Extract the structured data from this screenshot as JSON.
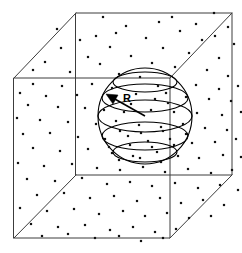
{
  "figure": {
    "labels": {
      "radius": "R"
    },
    "colors": {
      "background": "#ffffff",
      "cube_edge": "#3c3c3c",
      "sphere_line": "#000000",
      "particle": "#111111",
      "arrow": "#000000"
    },
    "label_positions": {
      "radius_x": 123,
      "radius_y": 93
    }
  },
  "chart_data": {
    "type": "scatter",
    "xlabel": "",
    "ylabel": "",
    "annotations": [
      "R"
    ],
    "geometry": {
      "cube": {
        "front_face": {
          "top_left": [
            14,
            78
          ],
          "top_right": [
            170,
            78
          ],
          "bottom_right": [
            170,
            238
          ],
          "bottom_left": [
            14,
            238
          ]
        },
        "back_face": {
          "top_left": [
            76,
            13
          ],
          "top_right": [
            232,
            13
          ],
          "bottom_right": [
            232,
            175
          ],
          "bottom_left": [
            76,
            175
          ]
        },
        "visible_connectors": [
          [
            [
              14,
              78
            ],
            [
              76,
              13
            ]
          ],
          [
            [
              170,
              78
            ],
            [
              232,
              13
            ]
          ],
          [
            [
              170,
              238
            ],
            [
              232,
              175
            ]
          ],
          [
            [
              14,
              238
            ],
            [
              76,
              175
            ]
          ]
        ]
      },
      "sphere": {
        "center": [
          145,
          116
        ],
        "radius_x": 47,
        "radius_y": 48,
        "latitude_rings_ry": [
          10,
          14,
          16,
          14,
          10
        ],
        "latitude_rings_cy": [
          82,
          98,
          116,
          136,
          152
        ]
      },
      "radius_arrow": {
        "from": [
          145,
          116
        ],
        "to": [
          110,
          96
        ]
      }
    },
    "particles": [
      [
        103,
        17
      ],
      [
        172,
        17
      ],
      [
        214,
        13
      ],
      [
        126,
        26
      ],
      [
        180,
        31
      ],
      [
        228,
        27
      ],
      [
        96,
        36
      ],
      [
        146,
        38
      ],
      [
        202,
        40
      ],
      [
        234,
        44
      ],
      [
        110,
        47
      ],
      [
        163,
        48
      ],
      [
        189,
        53
      ],
      [
        88,
        57
      ],
      [
        131,
        56
      ],
      [
        219,
        58
      ],
      [
        244,
        60
      ],
      [
        100,
        64
      ],
      [
        152,
        63
      ],
      [
        175,
        67
      ],
      [
        207,
        70
      ],
      [
        70,
        72
      ],
      [
        119,
        74
      ],
      [
        140,
        77
      ],
      [
        228,
        76
      ],
      [
        33,
        84
      ],
      [
        62,
        86
      ],
      [
        92,
        84
      ],
      [
        112,
        88
      ],
      [
        158,
        86
      ],
      [
        196,
        85
      ],
      [
        219,
        89
      ],
      [
        238,
        86
      ],
      [
        20,
        93
      ],
      [
        46,
        96
      ],
      [
        77,
        95
      ],
      [
        136,
        94
      ],
      [
        166,
        93
      ],
      [
        186,
        97
      ],
      [
        209,
        99
      ],
      [
        231,
        101
      ],
      [
        28,
        105
      ],
      [
        58,
        107
      ],
      [
        85,
        108
      ],
      [
        104,
        110
      ],
      [
        124,
        112
      ],
      [
        151,
        110
      ],
      [
        174,
        112
      ],
      [
        197,
        113
      ],
      [
        222,
        115
      ],
      [
        241,
        112
      ],
      [
        17,
        118
      ],
      [
        40,
        120
      ],
      [
        68,
        122
      ],
      [
        96,
        124
      ],
      [
        116,
        121
      ],
      [
        139,
        125
      ],
      [
        161,
        127
      ],
      [
        183,
        124
      ],
      [
        205,
        128
      ],
      [
        227,
        130
      ],
      [
        23,
        134
      ],
      [
        50,
        133
      ],
      [
        78,
        137
      ],
      [
        105,
        139
      ],
      [
        128,
        136
      ],
      [
        148,
        141
      ],
      [
        170,
        139
      ],
      [
        192,
        143
      ],
      [
        215,
        142
      ],
      [
        236,
        139
      ],
      [
        33,
        148
      ],
      [
        60,
        151
      ],
      [
        88,
        149
      ],
      [
        112,
        153
      ],
      [
        133,
        156
      ],
      [
        157,
        152
      ],
      [
        178,
        156
      ],
      [
        199,
        158
      ],
      [
        223,
        155
      ],
      [
        241,
        157
      ],
      [
        18,
        163
      ],
      [
        44,
        166
      ],
      [
        72,
        164
      ],
      [
        97,
        168
      ],
      [
        120,
        170
      ],
      [
        143,
        167
      ],
      [
        165,
        172
      ],
      [
        188,
        169
      ],
      [
        211,
        173
      ],
      [
        232,
        170
      ],
      [
        27,
        179
      ],
      [
        55,
        181
      ],
      [
        82,
        178
      ],
      [
        107,
        184
      ],
      [
        130,
        182
      ],
      [
        152,
        186
      ],
      [
        175,
        183
      ],
      [
        198,
        188
      ],
      [
        220,
        185
      ],
      [
        238,
        190
      ],
      [
        37,
        195
      ],
      [
        64,
        193
      ],
      [
        90,
        198
      ],
      [
        114,
        196
      ],
      [
        137,
        201
      ],
      [
        160,
        198
      ],
      [
        181,
        203
      ],
      [
        203,
        200
      ],
      [
        224,
        205
      ],
      [
        20,
        208
      ],
      [
        47,
        211
      ],
      [
        74,
        209
      ],
      [
        99,
        214
      ],
      [
        123,
        211
      ],
      [
        145,
        216
      ],
      [
        167,
        213
      ],
      [
        189,
        218
      ],
      [
        211,
        216
      ],
      [
        31,
        224
      ],
      [
        58,
        227
      ],
      [
        85,
        225
      ],
      [
        110,
        230
      ],
      [
        133,
        227
      ],
      [
        155,
        232
      ],
      [
        176,
        229
      ],
      [
        42,
        236
      ],
      [
        68,
        234
      ],
      [
        95,
        238
      ],
      [
        119,
        236
      ],
      [
        141,
        241
      ],
      [
        163,
        238
      ],
      [
        61,
        48
      ],
      [
        45,
        62
      ],
      [
        80,
        40
      ],
      [
        57,
        29
      ],
      [
        33,
        70
      ],
      [
        116,
        33
      ],
      [
        159,
        22
      ],
      [
        196,
        24
      ],
      [
        215,
        36
      ],
      [
        131,
        104
      ],
      [
        155,
        99
      ],
      [
        168,
        103
      ],
      [
        120,
        131
      ],
      [
        141,
        133
      ],
      [
        163,
        131
      ],
      [
        186,
        134
      ],
      [
        109,
        147
      ],
      [
        130,
        145
      ],
      [
        152,
        147
      ],
      [
        174,
        145
      ],
      [
        119,
        160
      ],
      [
        140,
        158
      ],
      [
        161,
        162
      ]
    ]
  }
}
